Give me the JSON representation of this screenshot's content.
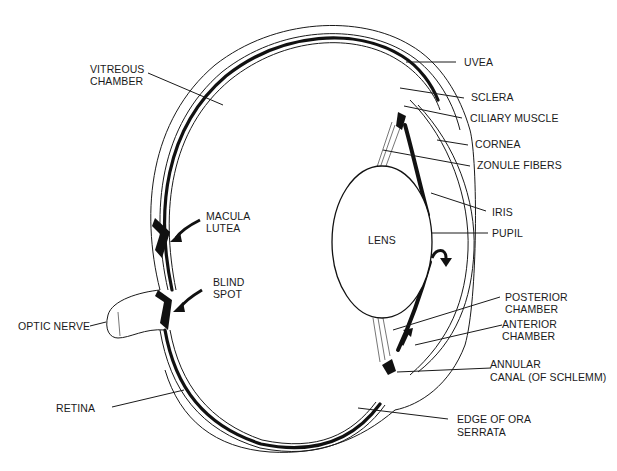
{
  "diagram": {
    "colors": {
      "ink": "#1a1a1a",
      "background": "#ffffff"
    },
    "structures": {
      "lens_label": "LENS"
    },
    "labels": [
      {
        "id": "vitreous",
        "lines": [
          "VITREOUS",
          "CHAMBER"
        ]
      },
      {
        "id": "uvea",
        "lines": [
          "UVEA"
        ]
      },
      {
        "id": "sclera",
        "lines": [
          "SCLERA"
        ]
      },
      {
        "id": "ciliary",
        "lines": [
          "CILIARY MUSCLE"
        ]
      },
      {
        "id": "cornea",
        "lines": [
          "CORNEA"
        ]
      },
      {
        "id": "zonule",
        "lines": [
          "ZONULE FIBERS"
        ]
      },
      {
        "id": "macula",
        "lines": [
          "MACULA",
          "LUTEA"
        ]
      },
      {
        "id": "iris",
        "lines": [
          "IRIS"
        ]
      },
      {
        "id": "pupil",
        "lines": [
          "PUPIL"
        ]
      },
      {
        "id": "blind",
        "lines": [
          "BLIND",
          "SPOT"
        ]
      },
      {
        "id": "posterior",
        "lines": [
          "POSTERIOR",
          "CHAMBER"
        ]
      },
      {
        "id": "optic",
        "lines": [
          "OPTIC NERVE"
        ]
      },
      {
        "id": "anterior",
        "lines": [
          "ANTERIOR",
          "CHAMBER"
        ]
      },
      {
        "id": "annular",
        "lines": [
          "ANNULAR",
          "CANAL (OF SCHLEMM)"
        ]
      },
      {
        "id": "retina",
        "lines": [
          "RETINA"
        ]
      },
      {
        "id": "ora",
        "lines": [
          "EDGE OF ORA",
          "SERRATA"
        ]
      }
    ]
  }
}
